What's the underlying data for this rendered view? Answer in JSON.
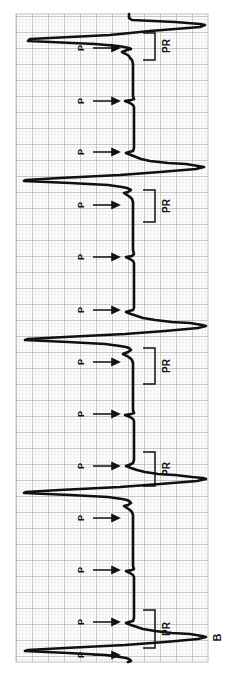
{
  "figure": {
    "panel_label": "B",
    "rotation_degrees": -90,
    "caption_letter_position": "bottom-right",
    "background_color": "#ffffff",
    "trace_color": "#111111",
    "grid": {
      "minor_color": "#d8d4d6",
      "major_color": "#a39ea2",
      "minor_spacing_px": 3.2,
      "major_every": 5,
      "left": 16,
      "top": 14,
      "right": 208,
      "bottom": 662
    }
  },
  "annotations": {
    "p_wave_label": "P",
    "pr_interval_label": "PR",
    "p_markers": [
      {
        "label": "P",
        "y": 48
      },
      {
        "label": "P",
        "y": 101
      },
      {
        "label": "P",
        "y": 152
      },
      {
        "label": "P",
        "y": 205
      },
      {
        "label": "P",
        "y": 257
      },
      {
        "label": "P",
        "y": 310
      },
      {
        "label": "P",
        "y": 362
      },
      {
        "label": "P",
        "y": 414
      },
      {
        "label": "P",
        "y": 466
      },
      {
        "label": "P",
        "y": 518
      },
      {
        "label": "P",
        "y": 570
      },
      {
        "label": "P",
        "y": 622
      },
      {
        "label": "P",
        "y": 655
      }
    ],
    "pr_brackets": [
      {
        "label": "PR",
        "y_top": 33,
        "y_bottom": 60,
        "text_y": 46
      },
      {
        "label": "PR",
        "y_top": 190,
        "y_bottom": 222,
        "text_y": 206
      },
      {
        "label": "PR",
        "y_top": 348,
        "y_bottom": 384,
        "text_y": 366
      },
      {
        "label": "PR",
        "y_top": 452,
        "y_bottom": 486,
        "text_y": 469
      },
      {
        "label": "PR",
        "y_top": 610,
        "y_bottom": 648,
        "text_y": 629
      }
    ]
  },
  "chart_data": {
    "type": "line",
    "title": "",
    "subtitle": "",
    "xlabel": "",
    "ylabel": "",
    "grid": true,
    "legend": false,
    "orientation": "rotated-90-ccw",
    "rhythm": "Mobitz I (Wenckebach) second degree AV block",
    "baseline_px": 129,
    "series": [
      {
        "name": "ECG lead",
        "points": [
          [
            129,
            14
          ],
          [
            129,
            18
          ],
          [
            132,
            20
          ],
          [
            175,
            22
          ],
          [
            200,
            24
          ],
          [
            205,
            25
          ],
          [
            200,
            27
          ],
          [
            150,
            31
          ],
          [
            110,
            35
          ],
          [
            30,
            39
          ],
          [
            28,
            41
          ],
          [
            95,
            44
          ],
          [
            118,
            46
          ],
          [
            124,
            47
          ],
          [
            129,
            48
          ],
          [
            131,
            49
          ],
          [
            127,
            50
          ],
          [
            122,
            52
          ],
          [
            126,
            54
          ],
          [
            129,
            56
          ],
          [
            130,
            58
          ],
          [
            132,
            60
          ],
          [
            133,
            64
          ],
          [
            133,
            70
          ],
          [
            133,
            78
          ],
          [
            133,
            86
          ],
          [
            133,
            92
          ],
          [
            133,
            96
          ],
          [
            134,
            99
          ],
          [
            131,
            100
          ],
          [
            125,
            101
          ],
          [
            130,
            103
          ],
          [
            133,
            105
          ],
          [
            134,
            107
          ],
          [
            134,
            112
          ],
          [
            134,
            118
          ],
          [
            134,
            124
          ],
          [
            134,
            130
          ],
          [
            134,
            138
          ],
          [
            134,
            144
          ],
          [
            134,
            148
          ],
          [
            133,
            151
          ],
          [
            129,
            152
          ],
          [
            126,
            153
          ],
          [
            131,
            155
          ],
          [
            136,
            157
          ],
          [
            141,
            159
          ],
          [
            150,
            161
          ],
          [
            168,
            163
          ],
          [
            186,
            164
          ],
          [
            198,
            166
          ],
          [
            204,
            167
          ],
          [
            196,
            169
          ],
          [
            160,
            172
          ],
          [
            120,
            175
          ],
          [
            60,
            178
          ],
          [
            26,
            180
          ],
          [
            24,
            181
          ],
          [
            70,
            183
          ],
          [
            108,
            185
          ],
          [
            122,
            187
          ],
          [
            127,
            188
          ],
          [
            129,
            189
          ],
          [
            131,
            190
          ],
          [
            128,
            192
          ],
          [
            124,
            193
          ],
          [
            127,
            195
          ],
          [
            130,
            197
          ],
          [
            132,
            199
          ],
          [
            133,
            202
          ],
          [
            133,
            208
          ],
          [
            133,
            215
          ],
          [
            133,
            222
          ],
          [
            133,
            232
          ],
          [
            133,
            242
          ],
          [
            133,
            250
          ],
          [
            134,
            254
          ],
          [
            132,
            256
          ],
          [
            126,
            257
          ],
          [
            130,
            259
          ],
          [
            133,
            261
          ],
          [
            134,
            263
          ],
          [
            134,
            270
          ],
          [
            134,
            280
          ],
          [
            134,
            290
          ],
          [
            134,
            298
          ],
          [
            134,
            304
          ],
          [
            134,
            308
          ],
          [
            133,
            310
          ],
          [
            129,
            311
          ],
          [
            126,
            312
          ],
          [
            131,
            314
          ],
          [
            137,
            316
          ],
          [
            143,
            318
          ],
          [
            155,
            320
          ],
          [
            172,
            322
          ],
          [
            190,
            323
          ],
          [
            202,
            325
          ],
          [
            206,
            326
          ],
          [
            198,
            328
          ],
          [
            165,
            331
          ],
          [
            125,
            334
          ],
          [
            65,
            337
          ],
          [
            28,
            339
          ],
          [
            25,
            340
          ],
          [
            68,
            342
          ],
          [
            105,
            344
          ],
          [
            120,
            346
          ],
          [
            126,
            347
          ],
          [
            129,
            348
          ],
          [
            131,
            350
          ],
          [
            128,
            352
          ],
          [
            123,
            354
          ],
          [
            127,
            356
          ],
          [
            130,
            358
          ],
          [
            132,
            360
          ],
          [
            133,
            363
          ],
          [
            133,
            368
          ],
          [
            133,
            376
          ],
          [
            133,
            386
          ],
          [
            133,
            396
          ],
          [
            133,
            404
          ],
          [
            133,
            410
          ],
          [
            134,
            413
          ],
          [
            131,
            414
          ],
          [
            125,
            415
          ],
          [
            130,
            417
          ],
          [
            133,
            419
          ],
          [
            134,
            421
          ],
          [
            134,
            428
          ],
          [
            134,
            438
          ],
          [
            134,
            448
          ],
          [
            134,
            456
          ],
          [
            134,
            460
          ],
          [
            133,
            463
          ],
          [
            129,
            465
          ],
          [
            126,
            466
          ],
          [
            131,
            468
          ],
          [
            137,
            470
          ],
          [
            145,
            472
          ],
          [
            158,
            474
          ],
          [
            175,
            475
          ],
          [
            192,
            477
          ],
          [
            203,
            478
          ],
          [
            206,
            479
          ],
          [
            197,
            481
          ],
          [
            160,
            484
          ],
          [
            120,
            487
          ],
          [
            60,
            490
          ],
          [
            26,
            492
          ],
          [
            24,
            493
          ],
          [
            70,
            495
          ],
          [
            108,
            497
          ],
          [
            122,
            499
          ],
          [
            127,
            500
          ],
          [
            129,
            501
          ],
          [
            131,
            503
          ],
          [
            128,
            505
          ],
          [
            124,
            506
          ],
          [
            127,
            508
          ],
          [
            130,
            510
          ],
          [
            132,
            512
          ],
          [
            133,
            515
          ],
          [
            133,
            521
          ],
          [
            133,
            530
          ],
          [
            133,
            540
          ],
          [
            133,
            550
          ],
          [
            133,
            560
          ],
          [
            133,
            566
          ],
          [
            134,
            569
          ],
          [
            132,
            570
          ],
          [
            126,
            571
          ],
          [
            130,
            573
          ],
          [
            133,
            575
          ],
          [
            134,
            577
          ],
          [
            134,
            584
          ],
          [
            134,
            594
          ],
          [
            134,
            604
          ],
          [
            134,
            612
          ],
          [
            134,
            618
          ],
          [
            133,
            621
          ],
          [
            129,
            622
          ],
          [
            126,
            623
          ],
          [
            131,
            625
          ],
          [
            137,
            627
          ],
          [
            143,
            629
          ],
          [
            155,
            631
          ],
          [
            172,
            633
          ],
          [
            190,
            634
          ],
          [
            202,
            636
          ],
          [
            206,
            637
          ],
          [
            198,
            639
          ],
          [
            165,
            642
          ],
          [
            125,
            645
          ],
          [
            65,
            648
          ],
          [
            28,
            650
          ],
          [
            25,
            651
          ],
          [
            68,
            653
          ],
          [
            105,
            655
          ],
          [
            120,
            657
          ],
          [
            126,
            658
          ],
          [
            129,
            659
          ],
          [
            131,
            661
          ],
          [
            128,
            662
          ]
        ]
      }
    ]
  }
}
